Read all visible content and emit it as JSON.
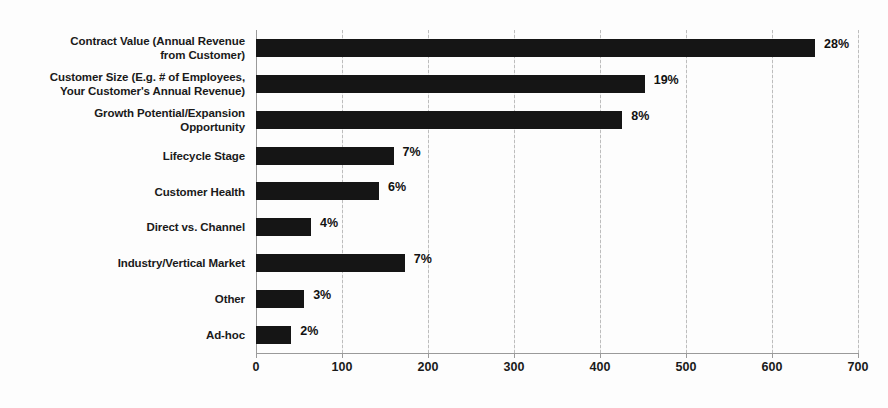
{
  "chart_data": {
    "type": "bar",
    "orientation": "horizontal",
    "title": "",
    "subtitle": "",
    "xlabel": "",
    "ylabel": "",
    "xlim": [
      0,
      700
    ],
    "xticks": [
      0,
      100,
      200,
      300,
      400,
      500,
      600,
      700
    ],
    "xtick_labels": [
      "0",
      "100",
      "200",
      "300",
      "400",
      "500",
      "600",
      "700"
    ],
    "grid": true,
    "grid_axis": "x",
    "legend": false,
    "bar_color": "#151515",
    "categories": [
      "Contract Value (Annual Revenue\nfrom Customer)",
      "Customer Size (E.g. # of Employees,\nYour Customer's Annual Revenue)",
      "Growth Potential/Expansion\nOpportunity",
      "Lifecycle Stage",
      "Customer Health",
      "Direct vs. Channel",
      "Industry/Vertical Market",
      "Other",
      "Ad-hoc"
    ],
    "values": [
      650,
      452,
      426,
      160,
      143,
      64,
      173,
      56,
      41
    ],
    "data_labels": [
      "28%",
      "19%",
      "8%",
      "7%",
      "6%",
      "4%",
      "7%",
      "3%",
      "2%"
    ],
    "data_label_percents": [
      28,
      19,
      8,
      7,
      6,
      4,
      7,
      3,
      2
    ]
  }
}
